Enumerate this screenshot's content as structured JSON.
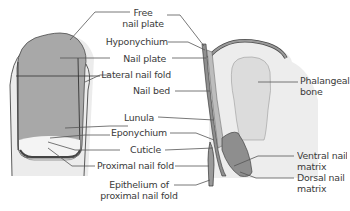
{
  "diagram": {
    "views": [
      "dorsal-view",
      "sagittal-section"
    ],
    "colors": {
      "nail_plate": "#a9a9a9",
      "skin": "#ededed",
      "lunula": "#f3f3f3",
      "bone": "#dedede",
      "matrix": "#8e8e8e",
      "outline": "#4a4a4a",
      "leader": "#555555",
      "text": "#3a3a3a"
    },
    "labels": {
      "free_nail_plate_1": "Free",
      "free_nail_plate_2": "nail plate",
      "hyponychium": "Hyponychium",
      "nail_plate": "Nail plate",
      "lateral_nail_fold": "Lateral nail fold",
      "nail_bed": "Nail bed",
      "lunula": "Lunula",
      "eponychium": "Eponychium",
      "cuticle": "Cuticle",
      "proximal_nail_fold": "Proximal nail fold",
      "epithelium_1": "Epithelium of",
      "epithelium_2": "proximal nail fold",
      "phalangeal_bone_1": "Phalangeal",
      "phalangeal_bone_2": "bone",
      "ventral_matrix_1": "Ventral nail",
      "ventral_matrix_2": "matrix",
      "dorsal_matrix_1": "Dorsal nail",
      "dorsal_matrix_2": "matrix"
    }
  }
}
